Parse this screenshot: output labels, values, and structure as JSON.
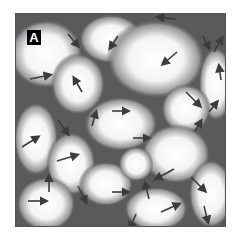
{
  "figure": {
    "panel_label": "A",
    "colors": {
      "domain_light": "#ffffff",
      "wall_dark": "#3a3a3a",
      "arrow": "#3c3c3c",
      "border": "#555555"
    },
    "arrows": [
      {
        "x": 52,
        "y": 20,
        "dx": 10,
        "dy": 12
      },
      {
        "x": 102,
        "y": 22,
        "dx": -8,
        "dy": 12
      },
      {
        "x": 66,
        "y": 78,
        "dx": -8,
        "dy": -14
      },
      {
        "x": 14,
        "y": 65,
        "dx": 20,
        "dy": -4
      },
      {
        "x": 96,
        "y": 97,
        "dx": 16,
        "dy": 0
      },
      {
        "x": 160,
        "y": 5,
        "dx": -18,
        "dy": -2
      },
      {
        "x": 161,
        "y": 38,
        "dx": -14,
        "dy": 12
      },
      {
        "x": 187,
        "y": 22,
        "dx": 6,
        "dy": 12
      },
      {
        "x": 198,
        "y": 38,
        "dx": 8,
        "dy": -14
      },
      {
        "x": 205,
        "y": 66,
        "dx": -2,
        "dy": -14
      },
      {
        "x": 170,
        "y": 78,
        "dx": 14,
        "dy": 14
      },
      {
        "x": 193,
        "y": 98,
        "dx": 8,
        "dy": -10
      },
      {
        "x": 42,
        "y": 106,
        "dx": 10,
        "dy": 14
      },
      {
        "x": 76,
        "y": 112,
        "dx": 4,
        "dy": -14
      },
      {
        "x": 6,
        "y": 133,
        "dx": 16,
        "dy": -10
      },
      {
        "x": 41,
        "y": 147,
        "dx": 20,
        "dy": -6
      },
      {
        "x": 33,
        "y": 178,
        "dx": 0,
        "dy": -16
      },
      {
        "x": 62,
        "y": 172,
        "dx": 8,
        "dy": 16
      },
      {
        "x": 12,
        "y": 187,
        "dx": 18,
        "dy": 0
      },
      {
        "x": 117,
        "y": 124,
        "dx": 16,
        "dy": 0
      },
      {
        "x": 179,
        "y": 117,
        "dx": 6,
        "dy": -10
      },
      {
        "x": 158,
        "y": 155,
        "dx": -18,
        "dy": 10
      },
      {
        "x": 175,
        "y": 163,
        "dx": 14,
        "dy": 14
      },
      {
        "x": 96,
        "y": 178,
        "dx": 16,
        "dy": 0
      },
      {
        "x": 133,
        "y": 185,
        "dx": -4,
        "dy": -16
      },
      {
        "x": 145,
        "y": 198,
        "dx": 18,
        "dy": -8
      },
      {
        "x": 120,
        "y": 200,
        "dx": -6,
        "dy": 14
      },
      {
        "x": 188,
        "y": 192,
        "dx": 4,
        "dy": 16
      }
    ],
    "domains": [
      {
        "cx": 30,
        "cy": 40,
        "rx": 30,
        "ry": 28
      },
      {
        "cx": 95,
        "cy": 25,
        "rx": 26,
        "ry": 20
      },
      {
        "cx": 62,
        "cy": 70,
        "rx": 22,
        "ry": 25
      },
      {
        "cx": 140,
        "cy": 45,
        "rx": 40,
        "ry": 32
      },
      {
        "cx": 200,
        "cy": 70,
        "rx": 14,
        "ry": 30
      },
      {
        "cx": 170,
        "cy": 95,
        "rx": 20,
        "ry": 20
      },
      {
        "cx": 105,
        "cy": 110,
        "rx": 30,
        "ry": 22
      },
      {
        "cx": 20,
        "cy": 125,
        "rx": 18,
        "ry": 30
      },
      {
        "cx": 55,
        "cy": 150,
        "rx": 20,
        "ry": 26
      },
      {
        "cx": 90,
        "cy": 170,
        "rx": 22,
        "ry": 18
      },
      {
        "cx": 160,
        "cy": 140,
        "rx": 28,
        "ry": 24
      },
      {
        "cx": 195,
        "cy": 180,
        "rx": 18,
        "ry": 28
      },
      {
        "cx": 140,
        "cy": 195,
        "rx": 26,
        "ry": 18
      },
      {
        "cx": 30,
        "cy": 190,
        "rx": 24,
        "ry": 22
      },
      {
        "cx": 120,
        "cy": 150,
        "rx": 14,
        "ry": 14
      }
    ]
  }
}
